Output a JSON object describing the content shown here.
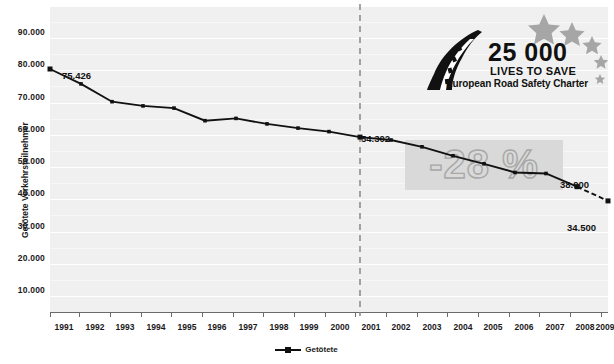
{
  "chart_data": {
    "type": "line",
    "title": "",
    "xlabel": "",
    "ylabel": "Getötete Verkehrsteilnehmer",
    "ylim": [
      0,
      95000
    ],
    "yticks": [
      10000,
      20000,
      30000,
      40000,
      50000,
      60000,
      70000,
      80000,
      90000
    ],
    "ytick_labels": [
      "10.000",
      "20.000",
      "30.000",
      "40.000",
      "50.000",
      "60.000",
      "70.000",
      "80.000",
      "90.000"
    ],
    "grid": true,
    "legend": [
      "Getötete"
    ],
    "legend_position": "bottom-center",
    "categories": [
      "1991",
      "1992",
      "1993",
      "1994",
      "1995",
      "1996",
      "1997",
      "1998",
      "1999",
      "2000",
      "2001",
      "2002",
      "2003",
      "2004",
      "2005",
      "2006",
      "2007",
      "2008",
      "2009"
    ],
    "values": [
      75426,
      70800,
      65300,
      64000,
      63300,
      59400,
      60100,
      58400,
      57100,
      56000,
      54302,
      53400,
      51300,
      48500,
      46000,
      43300,
      43000,
      38900,
      34500
    ],
    "series": [
      {
        "name": "Getötete",
        "values": [
          75426,
          70800,
          65300,
          64000,
          63300,
          59400,
          60100,
          58400,
          57100,
          56000,
          54302,
          53400,
          51300,
          48500,
          46000,
          43300,
          43000,
          38900,
          34500
        ]
      }
    ],
    "dashed_segment": {
      "from": "2008",
      "to": "2009"
    },
    "annotations": [
      {
        "name": "first-value",
        "text": "75.426",
        "x": "1991",
        "y": 75426
      },
      {
        "name": "baseline-value",
        "text": "54.302",
        "x": "2001",
        "y": 54302
      },
      {
        "name": "latest-value",
        "text": "38.900",
        "x": "2008",
        "y": 38900
      },
      {
        "name": "target-value",
        "text": "34.500",
        "x": "2009",
        "y": 34500
      },
      {
        "name": "reduction-band",
        "text": "-28 %"
      }
    ],
    "vline": {
      "x": "2001",
      "style": "dashed"
    },
    "colors": {
      "plot_background": "#f0f0f0",
      "gridline": "#ffffff",
      "series_line": "#111111",
      "axis": "#6b6b6b",
      "band": "#d9d9d9",
      "band_text": "#d9d9d9",
      "band_text_outline": "#a8a8a8",
      "star": "#a6a6a6"
    }
  },
  "logo": {
    "number": "25 000",
    "subtitle": "LIVES TO SAVE",
    "charter": "European Road Safety Charter"
  },
  "legend": {
    "label": "Getötete"
  }
}
